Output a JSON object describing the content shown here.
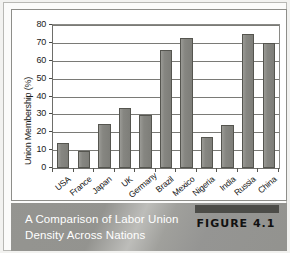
{
  "chart_data": {
    "type": "bar",
    "title": "",
    "xlabel": "",
    "ylabel": "Union Membership (%)",
    "ylim": [
      0,
      80
    ],
    "ytick_step": 10,
    "yticks": [
      0,
      10,
      20,
      30,
      40,
      50,
      60,
      70,
      80
    ],
    "grid": true,
    "legend": "none",
    "categories": [
      "USA",
      "France",
      "Japan",
      "UK",
      "Germany",
      "Brazil",
      "Mexico",
      "Nigeria",
      "India",
      "Russia",
      "China"
    ],
    "values": [
      14,
      9.5,
      24.5,
      33.5,
      29.5,
      66,
      73,
      17.5,
      24,
      75,
      70
    ],
    "bar_color": "#888884",
    "bar_edge_color": "#55554f"
  },
  "caption": {
    "line1": "A Comparison of Labor Union",
    "line2": "Density Across Nations",
    "figure_label": "FIGURE 4.1"
  }
}
